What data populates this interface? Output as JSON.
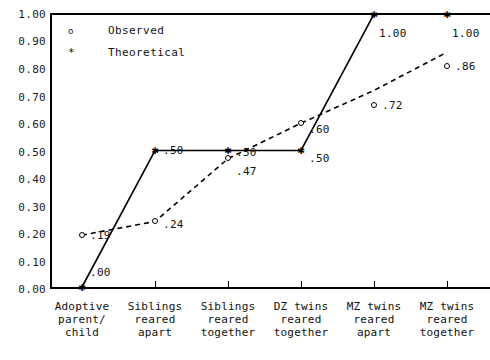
{
  "chart_data": {
    "type": "line",
    "title": "",
    "xlabel": "",
    "ylabel": "",
    "ylim": [
      0.0,
      1.0
    ],
    "grid": false,
    "legend_position": "top-left",
    "categories": [
      "Adoptive\nparent/\nchild",
      "Siblings\nreared\napart",
      "Siblings\nreared\ntogether",
      "DZ twins\nreared\ntogether",
      "MZ twins\nreared\napart",
      "MZ twins\nreared\ntogether"
    ],
    "yticks": [
      "0.00",
      "0.10",
      "0.20",
      "0.30",
      "0.40",
      "0.50",
      "0.60",
      "0.70",
      "0.80",
      "0.90",
      "1.00"
    ],
    "series": [
      {
        "name": "Observed",
        "marker": "o",
        "linestyle": "dashed",
        "values": [
          0.19,
          0.24,
          0.47,
          0.6,
          0.72,
          0.86
        ],
        "labels": [
          ".19",
          ".24",
          ".47",
          ".60",
          ".72",
          ".86"
        ]
      },
      {
        "name": "Theoretical",
        "marker": "*",
        "linestyle": "solid",
        "values": [
          0.0,
          0.5,
          0.5,
          0.5,
          1.0,
          1.0
        ],
        "labels": [
          ".00",
          ".50",
          ".50",
          ".50",
          "1.00",
          "1.00"
        ]
      }
    ]
  },
  "legend": {
    "items": [
      {
        "symbol": "o",
        "label": "Observed"
      },
      {
        "symbol": "*",
        "label": "Theoretical"
      }
    ]
  },
  "colors": {
    "axis": "#000000",
    "observed": "#000000",
    "theoretical": "#000000",
    "background": "#ffffff"
  }
}
